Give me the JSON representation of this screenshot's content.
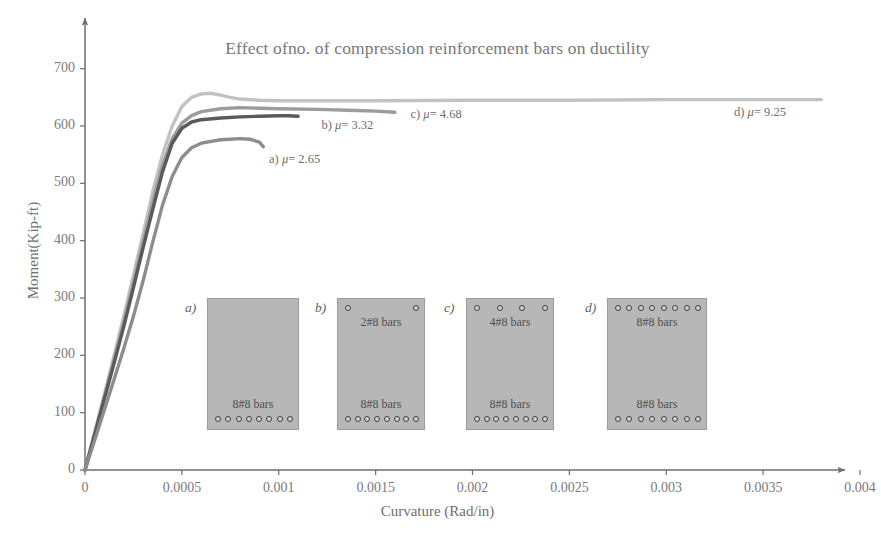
{
  "chart_data": {
    "type": "line",
    "title": "Effect ofno. of compression reinforcement bars on ductility",
    "xlabel": "Curvature (Rad/in)",
    "ylabel": "Moment(Kip-ft)",
    "xlim": [
      0,
      0.004
    ],
    "ylim": [
      0,
      750
    ],
    "xticks": [
      "0",
      "0.0005",
      "0.001",
      "0.0015",
      "0.002",
      "0.0025",
      "0.003",
      "0.0035",
      "0.004"
    ],
    "xtick_values": [
      0,
      0.0005,
      0.001,
      0.0015,
      0.002,
      0.0025,
      0.003,
      0.0035,
      0.004
    ],
    "yticks": [
      "0",
      "100",
      "200",
      "300",
      "400",
      "500",
      "600",
      "700"
    ],
    "ytick_values": [
      0,
      100,
      200,
      300,
      400,
      500,
      600,
      700
    ],
    "grid": false,
    "legend_position": "inline-annotations",
    "series": [
      {
        "name": "a",
        "label": "a)  μ= 2.65",
        "mu": 2.65,
        "color": "#8d8d8d",
        "points": [
          [
            0.0,
            0
          ],
          [
            5e-05,
            52
          ],
          [
            0.0001,
            105
          ],
          [
            0.00015,
            158
          ],
          [
            0.0002,
            212
          ],
          [
            0.00025,
            268
          ],
          [
            0.0003,
            330
          ],
          [
            0.00035,
            398
          ],
          [
            0.0004,
            462
          ],
          [
            0.00045,
            512
          ],
          [
            0.0005,
            545
          ],
          [
            0.00055,
            562
          ],
          [
            0.0006,
            570
          ],
          [
            0.0007,
            576
          ],
          [
            0.0008,
            578
          ],
          [
            0.00085,
            577
          ],
          [
            0.0009,
            572
          ],
          [
            0.00092,
            564
          ]
        ]
      },
      {
        "name": "b",
        "label": "b)  μ= 3.32",
        "mu": 3.32,
        "color": "#5a5a5a",
        "points": [
          [
            0.0,
            0
          ],
          [
            5e-05,
            62
          ],
          [
            0.0001,
            124
          ],
          [
            0.00015,
            186
          ],
          [
            0.0002,
            250
          ],
          [
            0.00025,
            318
          ],
          [
            0.0003,
            388
          ],
          [
            0.00035,
            455
          ],
          [
            0.0004,
            520
          ],
          [
            0.00045,
            570
          ],
          [
            0.0005,
            596
          ],
          [
            0.00055,
            607
          ],
          [
            0.0006,
            611
          ],
          [
            0.0007,
            614
          ],
          [
            0.0008,
            616
          ],
          [
            0.0009,
            617
          ],
          [
            0.001,
            618
          ],
          [
            0.00105,
            618
          ],
          [
            0.0011,
            617
          ]
        ]
      },
      {
        "name": "c",
        "label": "c)  μ= 4.68",
        "mu": 4.68,
        "color": "#9c9c9c",
        "points": [
          [
            0.0,
            0
          ],
          [
            5e-05,
            64
          ],
          [
            0.0001,
            128
          ],
          [
            0.00015,
            192
          ],
          [
            0.0002,
            258
          ],
          [
            0.00025,
            326
          ],
          [
            0.0003,
            398
          ],
          [
            0.00035,
            468
          ],
          [
            0.0004,
            532
          ],
          [
            0.00045,
            578
          ],
          [
            0.0005,
            605
          ],
          [
            0.00055,
            618
          ],
          [
            0.0006,
            625
          ],
          [
            0.0007,
            630
          ],
          [
            0.0008,
            632
          ],
          [
            0.0009,
            631
          ],
          [
            0.001,
            630
          ],
          [
            0.0012,
            629
          ],
          [
            0.0014,
            627
          ],
          [
            0.0015,
            626
          ],
          [
            0.0016,
            624
          ]
        ]
      },
      {
        "name": "d",
        "label": "d)  μ= 9.25",
        "mu": 9.25,
        "color": "#c2c2c2",
        "points": [
          [
            0.0,
            0
          ],
          [
            5e-05,
            66
          ],
          [
            0.0001,
            132
          ],
          [
            0.00015,
            200
          ],
          [
            0.0002,
            268
          ],
          [
            0.00025,
            340
          ],
          [
            0.0003,
            412
          ],
          [
            0.00035,
            486
          ],
          [
            0.0004,
            550
          ],
          [
            0.00045,
            600
          ],
          [
            0.0005,
            634
          ],
          [
            0.00055,
            650
          ],
          [
            0.0006,
            656
          ],
          [
            0.00065,
            657
          ],
          [
            0.0007,
            654
          ],
          [
            0.00075,
            650
          ],
          [
            0.0008,
            647
          ],
          [
            0.0009,
            645
          ],
          [
            0.001,
            644
          ],
          [
            0.0015,
            644
          ],
          [
            0.002,
            645
          ],
          [
            0.0025,
            645
          ],
          [
            0.003,
            646
          ],
          [
            0.0035,
            646
          ],
          [
            0.0038,
            646
          ]
        ]
      }
    ],
    "annotations": [
      {
        "text": "a)  μ= 2.65",
        "x": 0.00095,
        "y": 540
      },
      {
        "text": "b)  μ= 3.32",
        "x": 0.00122,
        "y": 600
      },
      {
        "text": "c)  μ= 4.68",
        "x": 0.00168,
        "y": 620
      },
      {
        "text": "d)  μ= 9.25",
        "x": 0.00335,
        "y": 622
      }
    ],
    "sections": [
      {
        "letter": "a)",
        "top_caption": "",
        "top_bars": 0,
        "bottom_caption": "8#8 bars",
        "bottom_bars": 8
      },
      {
        "letter": "b)",
        "top_caption": "2#8 bars",
        "top_bars": 2,
        "bottom_caption": "8#8 bars",
        "bottom_bars": 8
      },
      {
        "letter": "c)",
        "top_caption": "4#8 bars",
        "top_bars": 4,
        "bottom_caption": "8#8 bars",
        "bottom_bars": 8
      },
      {
        "letter": "d)",
        "top_caption": "8#8 bars",
        "top_bars": 8,
        "bottom_caption": "8#8 bars",
        "bottom_bars": 8
      }
    ]
  },
  "colors": {
    "axis": "#6e6e6e",
    "text": "#6f6f71",
    "section_fill": "#b9b9b9"
  }
}
